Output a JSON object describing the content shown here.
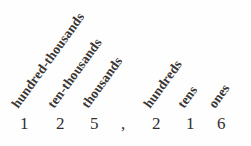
{
  "figure": {
    "name": "place-value-chart",
    "number_text": "125,216",
    "background_color": "#fefefe",
    "text_color": "#332f2e",
    "label_color": "#3a3634",
    "label_rotation_degrees": -54,
    "columns": [
      {
        "label": "hundred-thousands",
        "digit": "1",
        "x": 20
      },
      {
        "label": "ten-thousands",
        "digit": "2",
        "x": 56
      },
      {
        "label": "thousands",
        "digit": "5",
        "x": 90
      },
      {
        "label": "hundreds",
        "digit": "2",
        "x": 152
      },
      {
        "label": "tens",
        "digit": "1",
        "x": 186
      },
      {
        "label": "ones",
        "digit": "6",
        "x": 217
      }
    ],
    "separator": {
      "glyph": ",",
      "x": 121
    }
  }
}
